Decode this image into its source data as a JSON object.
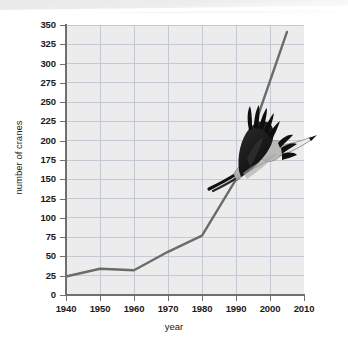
{
  "chart_data": {
    "type": "line",
    "title": "",
    "xlabel": "year",
    "ylabel": "number of cranes",
    "xlim": [
      1940,
      2010
    ],
    "ylim": [
      0,
      350
    ],
    "grid": true,
    "legend": false,
    "x_ticks": [
      1940,
      1950,
      1960,
      1970,
      1980,
      1990,
      2000,
      2010
    ],
    "y_ticks": [
      0,
      25,
      50,
      75,
      100,
      125,
      150,
      175,
      200,
      225,
      250,
      275,
      300,
      325,
      350
    ],
    "x": [
      1940,
      1950,
      1960,
      1970,
      1980,
      1990,
      2005
    ],
    "values": [
      24,
      34,
      32,
      56,
      77,
      150,
      341
    ],
    "series": [
      {
        "name": "number of cranes",
        "x": [
          1940,
          1950,
          1960,
          1970,
          1980,
          1990,
          2005
        ],
        "values": [
          24,
          34,
          32,
          56,
          77,
          150,
          341
        ],
        "color": "#6b6b6b"
      }
    ],
    "annotations": [
      {
        "name": "flying-crane-photo",
        "description": "photograph of a whooping crane in flight overlaid on the plot"
      }
    ]
  },
  "axes": {
    "x_title": "year",
    "y_title": "number of cranes",
    "x_tick_labels": [
      "1940",
      "1950",
      "1960",
      "1970",
      "1980",
      "1990",
      "2000",
      "2010"
    ],
    "y_tick_labels": [
      "0",
      "25",
      "50",
      "75",
      "100",
      "125",
      "150",
      "175",
      "200",
      "225",
      "250",
      "275",
      "300",
      "325",
      "350"
    ]
  },
  "colors": {
    "plot_background": "#ececed",
    "grid": "#b9c2cc",
    "axis": "#6f6f6f",
    "line": "#6b6b6b",
    "text": "#1a1a1a",
    "page_background": "#ffffff"
  }
}
